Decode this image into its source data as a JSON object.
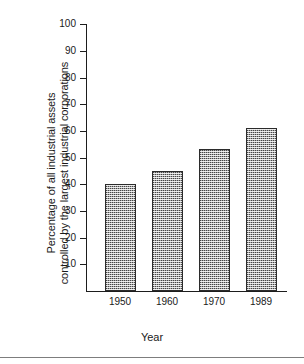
{
  "chart_data": {
    "type": "bar",
    "title": "",
    "subtitle": "",
    "categories": [
      "1950",
      "1960",
      "1970",
      "1989"
    ],
    "values": [
      40,
      45,
      53,
      61
    ],
    "series": [
      {
        "name": "Percentage of all industrial assets controlled by the largest industrial corporations",
        "values": [
          40,
          45,
          53,
          61
        ]
      }
    ],
    "xlabel": "Year",
    "ylabel_line1": "Percentage of all industrial assets",
    "ylabel_line2": "controlled by the largest industrial corporations",
    "ylim": [
      0,
      100
    ],
    "ytick_values": [
      10,
      20,
      30,
      40,
      50,
      60,
      70,
      80,
      90,
      100
    ],
    "ytick_labels": [
      "10",
      "20",
      "30",
      "40",
      "50",
      "60",
      "70",
      "80",
      "90",
      "100"
    ],
    "grid": false,
    "legend": false,
    "legend_position": "none",
    "bar_fill_color": "#a8a8a8",
    "bar_edge_color": "#2b2b2b",
    "axis_color": "#1d1d1d",
    "background_color": "#ffffff"
  },
  "axes": {
    "y_title_line1": "Percentage of all industrial assets",
    "y_title_line2": "controlled by the largest industrial corporations",
    "x_title": "Year"
  },
  "yticks": [
    {
      "label": "100"
    },
    {
      "label": "90"
    },
    {
      "label": "80"
    },
    {
      "label": "70"
    },
    {
      "label": "60"
    },
    {
      "label": "50"
    },
    {
      "label": "40"
    },
    {
      "label": "30"
    },
    {
      "label": "20"
    },
    {
      "label": "10"
    }
  ],
  "bars": [
    {
      "label": "1950",
      "value": 40
    },
    {
      "label": "1960",
      "value": 45
    },
    {
      "label": "1970",
      "value": 53
    },
    {
      "label": "1989",
      "value": 61
    }
  ]
}
